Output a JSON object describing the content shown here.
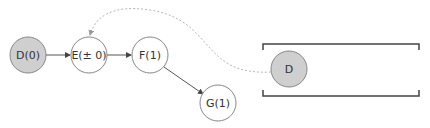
{
  "diagram": {
    "nodes": [
      {
        "id": "D0",
        "label": "D(0)",
        "cx": 28,
        "cy": 55,
        "r": 18,
        "fill": "#cfcfcf"
      },
      {
        "id": "E",
        "label": "E(± 0)",
        "cx": 89,
        "cy": 55,
        "r": 18,
        "fill": "#ffffff"
      },
      {
        "id": "F",
        "label": "F(1)",
        "cx": 150,
        "cy": 55,
        "r": 18,
        "fill": "#ffffff"
      },
      {
        "id": "G",
        "label": "G(1)",
        "cx": 218,
        "cy": 103,
        "r": 18,
        "fill": "#ffffff"
      }
    ],
    "queue": {
      "item": {
        "label": "D",
        "cx": 289,
        "cy": 69,
        "r": 18,
        "fill": "#cfcfcf"
      }
    },
    "edges": [
      {
        "from": "D0",
        "to": "E"
      },
      {
        "from": "E",
        "to": "F"
      },
      {
        "from": "F",
        "to": "G"
      }
    ],
    "dashed_link": {
      "from": "queue.D",
      "to": "E"
    },
    "colors": {
      "stroke": "#888888",
      "edge": "#555555",
      "dashed": "#b0b0b0",
      "bracket": "#444444",
      "filled": "#cfcfcf"
    }
  }
}
